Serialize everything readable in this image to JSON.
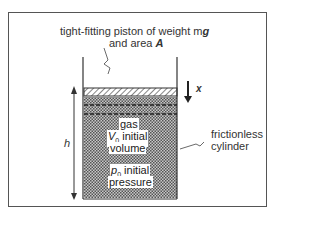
{
  "diagram": {
    "piston_label_line1": "tight-fitting piston of weight m",
    "piston_label_g": "g",
    "piston_label_line2": "and area ",
    "piston_label_A": "A",
    "displacement_label": "x",
    "height_label": "h",
    "gas_label": "gas",
    "volume_symbol": "V",
    "volume_sub": "0",
    "volume_text": " initial",
    "volume_text2": "volume",
    "pressure_symbol": "p",
    "pressure_sub": "0",
    "pressure_text": " initial",
    "pressure_text2": "pressure",
    "cylinder_label_line1": "frictionless",
    "cylinder_label_line2": "cylinder",
    "colors": {
      "line": "#333333",
      "gas_fill": "#9a9a9a",
      "background": "#ffffff"
    }
  }
}
